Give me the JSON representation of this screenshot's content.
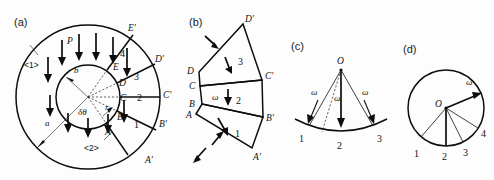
{
  "figure": {
    "width": 494,
    "height": 180,
    "background": "#fdfdfd",
    "ink": "#0d0d0d"
  },
  "panels": {
    "a": {
      "label": "(a)",
      "outer_region_label": "<1>",
      "inner_region_label": "<2>",
      "radius_outer_label": "a",
      "radius_inner_label": "b",
      "pressure_label": "P",
      "angle_label": "δθ",
      "small_radius_label": "r",
      "inner_points": [
        "A",
        "B",
        "C",
        "D",
        "E"
      ],
      "outer_points": [
        "A'",
        "B'",
        "C'",
        "D'",
        "E'"
      ],
      "sector_numbers": [
        "1",
        "2",
        "3",
        "4"
      ],
      "pressure_arrow_count": 9
    },
    "b": {
      "label": "(b)",
      "omega_label": "ω",
      "left_points": [
        "A",
        "B",
        "C",
        "D"
      ],
      "right_points": [
        "A'",
        "B'",
        "C'",
        "D'"
      ],
      "segment_numbers": [
        "1",
        "2",
        "3"
      ],
      "external_arrow_count": 3
    },
    "c": {
      "label": "(c)",
      "center_label": "O",
      "omega_labels": [
        "ω",
        "ω",
        "ω"
      ],
      "point_numbers": [
        "1",
        "2",
        "3"
      ]
    },
    "d": {
      "label": "(d)",
      "center_label": "O",
      "omega_label": "ω",
      "point_numbers": [
        "1",
        "2",
        "3",
        "4"
      ]
    }
  }
}
